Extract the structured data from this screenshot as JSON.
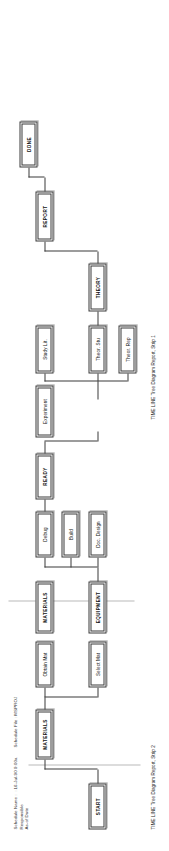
{
  "report": {
    "title": "TIME LINE Tree Diagram Report",
    "captions": {
      "strip1": "TIME LINE Tree Diagram Report, Strip 1",
      "strip2": "TIME LINE Tree Diagram Report, Strip 2"
    }
  },
  "header": {
    "labels": "Schedule Name\nResponsible\nAs-of Date",
    "label_lines": [
      "Schedule Name",
      "Responsible",
      "As-of Date"
    ],
    "dots": ": : : : : :",
    "date_value": "16-Jul-90  9:00a",
    "file_label": "Schedule File :",
    "file_value": "MSPROJ",
    "file_line": "Schedule File  :   MSPROJ"
  },
  "diagram": {
    "type": "tree",
    "orientation": "rotated-90-ccw",
    "nodes": {
      "start": "START",
      "materials_root": "MATERIALS",
      "select_mat": "Select Mat",
      "obtain_mat": "Obtain Mat",
      "materials_mid": "MATERIALS",
      "equipment": "EQUIPMENT",
      "doc_design": "Doc. Design",
      "build": "Build",
      "debug": "Debug",
      "ready": "READY",
      "experiment": "Experiment",
      "study_lit": "Study Lit.",
      "theor_stu": "Theor. Stu",
      "theor_rep": "Theor. Rep",
      "theory": "THEORY",
      "report": "REPORT",
      "done": "DONE"
    },
    "milestones": [
      "START",
      "MATERIALS",
      "EQUIPMENT",
      "READY",
      "THEORY",
      "REPORT",
      "DONE"
    ]
  },
  "colors": {
    "ink": "#3a3a3a",
    "paper": "#ffffff",
    "rule": "#b9b9b9"
  }
}
